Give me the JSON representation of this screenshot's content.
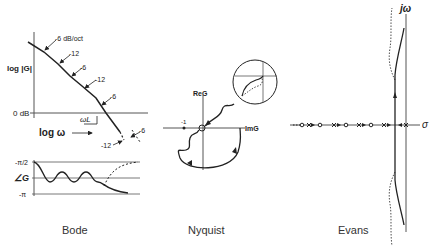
{
  "bode": {
    "caption": "Bode",
    "magnitude": {
      "ylabel": "log |G|",
      "zero_db": "0 dB",
      "slopes": [
        "-6 dB/oct",
        "-12",
        "-6",
        "-12",
        "-6",
        "-6",
        "-12"
      ],
      "crossover": "ωL"
    },
    "xlabel": "log ω",
    "phase": {
      "ylabel": "∠G",
      "top_tick": "-π/2",
      "bottom_tick": "-π"
    }
  },
  "nyquist": {
    "caption": "Nyquist",
    "real_axis": "ReG",
    "imag_axis": "ImG",
    "minus_one": "-1"
  },
  "evans": {
    "caption": "Evans",
    "imag_axis": "jω",
    "real_axis": "σ"
  },
  "colors": {
    "ink": "#222222",
    "axis": "#555555",
    "background": "#ffffff"
  }
}
